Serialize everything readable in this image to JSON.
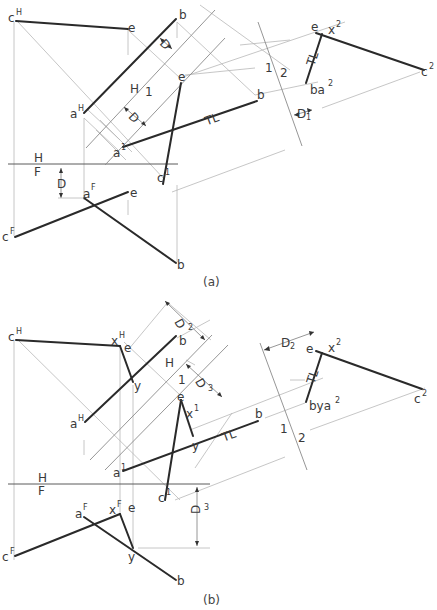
{
  "figure_a": {
    "caption": "(a)",
    "fold_lines": {
      "hf_top": "H",
      "hf_bottom": "F",
      "h1_left": "H",
      "h1_right": "1",
      "p12_left": "1",
      "p12_right": "2"
    },
    "labels": {
      "cH": "c",
      "cH_sup": "H",
      "eH": "e",
      "bH": "b",
      "aH": "a",
      "aH_sup": "H",
      "e1": "e",
      "b1": "b",
      "a1": "a",
      "a1_sup": "1",
      "c1": "c",
      "c1_sup": "1",
      "tl1": "TL",
      "aF": "a",
      "aF_sup": "F",
      "eF": "e",
      "cF": "c",
      "cF_sup": "F",
      "bF": "b",
      "e2": "e",
      "x2": "x",
      "x2_sup": "2",
      "c2": "c",
      "c2_sup": "2",
      "ba2": "ba",
      "ba2_sup": "2",
      "tl2": "TL"
    },
    "dimensions": {
      "d_top": "D",
      "d_top_sub": "1",
      "d_mid": "D",
      "d_hf": "D",
      "d_12": "D",
      "d_12_sub": "1"
    }
  },
  "figure_b": {
    "caption": "(b)",
    "fold_lines": {
      "hf_top": "H",
      "hf_bottom": "F",
      "h1_left": "H",
      "h1_right": "1",
      "p12_left": "1",
      "p12_right": "2"
    },
    "labels": {
      "cH": "c",
      "cH_sup": "H",
      "xH": "x",
      "xH_sup": "H",
      "eH": "e",
      "bH": "b",
      "yH": "y",
      "aH": "a",
      "aH_sup": "H",
      "e1": "e",
      "x1": "x",
      "x1_sup": "1",
      "y1": "y",
      "b1": "b",
      "a1": "a",
      "a1_sup": "1",
      "c1": "c",
      "c1_sup": "1",
      "tl1": "TL",
      "aF": "a",
      "aF_sup": "F",
      "xF": "x",
      "xF_sup": "F",
      "eF": "e",
      "cF": "c",
      "cF_sup": "F",
      "yF": "y",
      "bF": "b",
      "e2": "e",
      "x2": "x",
      "x2_sup": "2",
      "c2": "c",
      "c2_sup": "2",
      "bya2": "bya",
      "bya2_sup": "2",
      "tl2": "TL"
    },
    "dimensions": {
      "d2_top": "D",
      "d2_top_sub": "2",
      "d3_mid": "D",
      "d3_mid_sub": "3",
      "d2_right": "D",
      "d2_right_sub": "2",
      "d3_front": "D",
      "d3_front_sub": "3"
    }
  }
}
